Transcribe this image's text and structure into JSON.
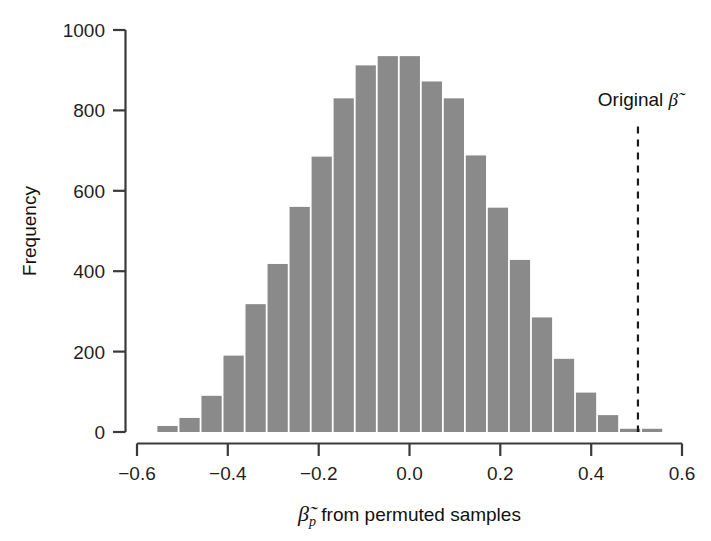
{
  "chart_data": {
    "type": "bar",
    "title": "",
    "subtitle": "",
    "xlabel": "β̃p from permuted samples",
    "xlabel_parts": {
      "symbol": "β",
      "tilde": "̃",
      "subscript": "p",
      "rest": " from permuted samples"
    },
    "ylabel": "Frequency",
    "xlim": [
      -0.6,
      0.6
    ],
    "ylim": [
      0,
      1000
    ],
    "xticks": [
      -0.6,
      -0.4,
      -0.2,
      0.0,
      0.2,
      0.4,
      0.6
    ],
    "xticklabels": [
      "−0.6",
      "−0.4",
      "−0.2",
      "0.0",
      "0.2",
      "0.4",
      "0.6"
    ],
    "yticks": [
      0,
      200,
      400,
      600,
      800,
      1000
    ],
    "yticklabels": [
      "0",
      "200",
      "400",
      "600",
      "800",
      "1000"
    ],
    "grid": false,
    "legend": null,
    "bar_color": "#8a8a8a",
    "bar_edge_color": "#ffffff",
    "axis_color": "#3a3a3a",
    "bin_width": 0.0485,
    "bin_centers": [
      -0.5328,
      -0.4843,
      -0.4358,
      -0.3873,
      -0.3388,
      -0.2903,
      -0.2418,
      -0.1933,
      -0.1448,
      -0.0963,
      -0.0478,
      0.0007,
      0.0492,
      0.0977,
      0.1462,
      0.1947,
      0.2432,
      0.2917,
      0.3402,
      0.3887,
      0.4372,
      0.4857,
      0.5342
    ],
    "categories": [
      "-0.53",
      "-0.48",
      "-0.44",
      "-0.39",
      "-0.34",
      "-0.29",
      "-0.24",
      "-0.19",
      "-0.14",
      "-0.10",
      "-0.05",
      "0.00",
      "0.05",
      "0.10",
      "0.15",
      "0.19",
      "0.24",
      "0.29",
      "0.34",
      "0.39",
      "0.44",
      "0.49",
      "0.53"
    ],
    "values": [
      15,
      35,
      90,
      190,
      318,
      418,
      560,
      685,
      830,
      912,
      935,
      935,
      872,
      830,
      688,
      558,
      428,
      285,
      182,
      98,
      42,
      8,
      8
    ],
    "annotations": [
      {
        "name": "original-beta-marker",
        "text": "Original β̃",
        "text_parts": {
          "label": "Original",
          "symbol": "β"
        },
        "x": 0.503,
        "style": "dashed-vertical-line",
        "line_color": "#1a1a1a",
        "label_y": 760
      }
    ]
  }
}
